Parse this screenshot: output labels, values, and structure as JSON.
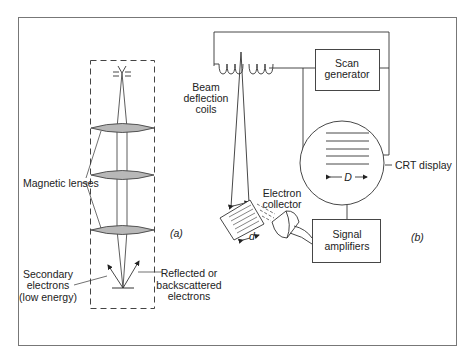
{
  "figure": {
    "panel_a": {
      "label": "(a)",
      "labels": {
        "magnetic_lenses": "Magnetic lenses",
        "secondary_1": "Secondary",
        "secondary_2": "electrons",
        "secondary_3": "(low energy)",
        "reflected_1": "Reflected or",
        "reflected_2": "backscattered",
        "reflected_3": "electrons"
      }
    },
    "panel_b": {
      "label": "(b)",
      "labels": {
        "beam_1": "Beam",
        "beam_2": "deflection",
        "beam_3": "coils",
        "scan_1": "Scan",
        "scan_2": "generator",
        "crt": "CRT display",
        "crt_dim": "D",
        "collector_1": "Electron",
        "collector_2": "collector",
        "specimen_dim": "d",
        "amp_1": "Signal",
        "amp_2": "amplifiers"
      }
    },
    "colors": {
      "line": "#2a2a2a",
      "lens_fill": "#b8b8b8",
      "frame": "#777777"
    }
  }
}
